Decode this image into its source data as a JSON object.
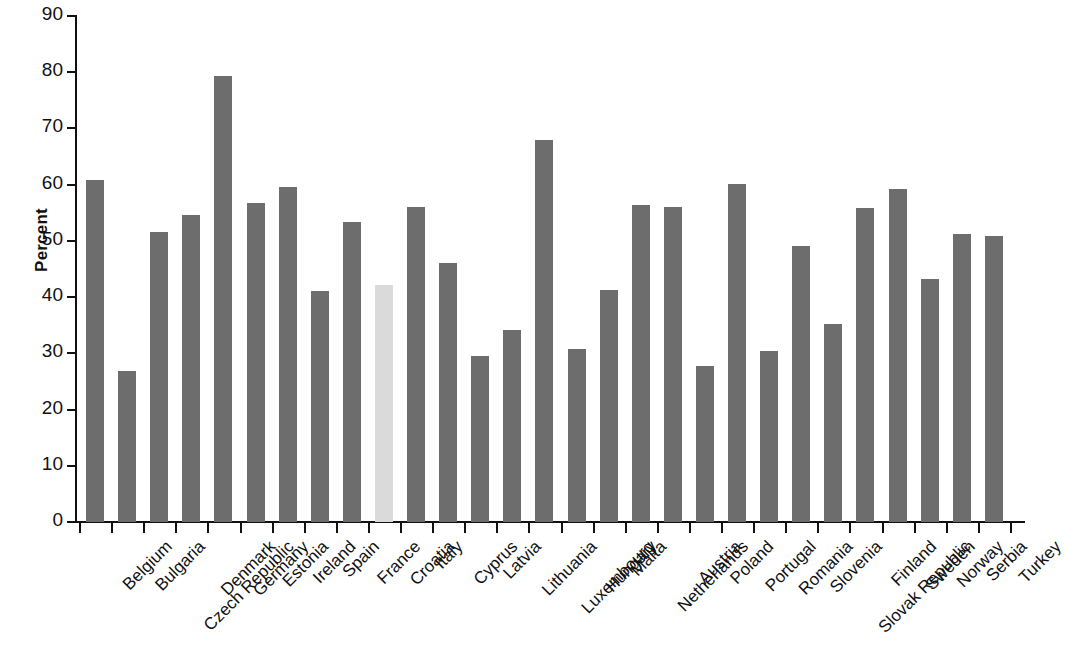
{
  "chart_data": {
    "type": "bar",
    "title": "",
    "subtitle": "",
    "xlabel": "",
    "ylabel": "Percent",
    "ylim": [
      0,
      90
    ],
    "yticks": [
      0,
      10,
      20,
      30,
      40,
      50,
      60,
      70,
      80,
      90
    ],
    "grid": false,
    "legend": null,
    "bar_color": "#6d6d6d",
    "highlight_color": "#dadada",
    "highlight_category": "Croatia",
    "categories": [
      "Belgium",
      "Bulgaria",
      "Czech Republic",
      "Denmark",
      "Germany",
      "Estonia",
      "Ireland",
      "Spain",
      "France",
      "Croatia",
      "Italy",
      "Cyprus",
      "Latvia",
      "Lithuania",
      "Luxembourg",
      "Hungary",
      "Malta",
      "Netherlands",
      "Austria",
      "Poland",
      "Portugal",
      "Romania",
      "Slovenia",
      "Slovak Republic",
      "Finland",
      "Sweden",
      "Norway",
      "Serbia",
      "Turkey"
    ],
    "values": [
      60.9,
      26.9,
      51.6,
      54.6,
      79.3,
      56.7,
      59.5,
      41.1,
      53.4,
      42.2,
      56.1,
      46.0,
      29.6,
      34.2,
      68.0,
      30.7,
      41.3,
      56.4,
      56.1,
      27.8,
      60.2,
      30.5,
      49.1,
      35.2,
      55.9,
      59.2,
      43.2,
      51.2,
      50.9
    ]
  }
}
